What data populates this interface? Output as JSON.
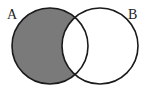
{
  "diagram": {
    "type": "venn",
    "shaded_region": "A minus B",
    "colors": {
      "shade": "#7a7a7a",
      "stroke": "#1a1a1a",
      "background": "#ffffff"
    },
    "sets": [
      {
        "label": "A",
        "cx": 50,
        "cy": 46,
        "r": 38,
        "label_x": 7,
        "label_y": 19
      },
      {
        "label": "B",
        "cx": 100,
        "cy": 46,
        "r": 38,
        "label_x": 128,
        "label_y": 19
      }
    ]
  }
}
